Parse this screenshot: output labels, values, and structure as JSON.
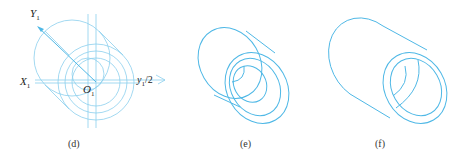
{
  "figure": {
    "panels": [
      {
        "id": "d",
        "caption": "(d)",
        "labels": {
          "y_axis": "Y",
          "y_axis_sub": "1",
          "x_axis": "X",
          "x_axis_sub": "1",
          "origin": "O",
          "origin_sub": "1",
          "offset": "y",
          "offset_sub": "1",
          "offset_suffix": "/2"
        },
        "description": "Construction of isometric concentric circles with axes and offset y1/2"
      },
      {
        "id": "e",
        "caption": "(e)",
        "description": "Isometric hollow cylinder outline with concentric ellipses"
      },
      {
        "id": "f",
        "caption": "(f)",
        "description": "Finished isometric view of hollow cylindrical bushing"
      }
    ],
    "colors": {
      "line": "#4fb8e6",
      "construction": "#8ccfee",
      "text": "#222222"
    }
  }
}
